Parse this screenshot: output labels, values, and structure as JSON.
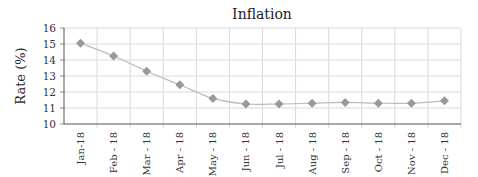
{
  "chart_data": {
    "type": "line",
    "title": "Inflation",
    "xlabel": "",
    "ylabel": "Rate (%)",
    "categories": [
      "Jan-18",
      "Feb - 18",
      "Mar - 18",
      "Apr - 18",
      "May - 18",
      "Jun - 18",
      "Jul - 18",
      "Aug - 18",
      "Sep - 18",
      "Oct - 18",
      "Nov - 18",
      "Dec - 18"
    ],
    "series": [
      {
        "name": "Inflation",
        "values": [
          15.05,
          14.25,
          13.3,
          12.45,
          11.6,
          11.25,
          11.25,
          11.3,
          11.35,
          11.3,
          11.3,
          11.45
        ],
        "color": "#999999",
        "marker": "diamond"
      }
    ],
    "ylim": [
      10,
      16
    ],
    "yticks": [
      10,
      11,
      12,
      13,
      14,
      15,
      16
    ],
    "grid": true,
    "legend": "none"
  }
}
